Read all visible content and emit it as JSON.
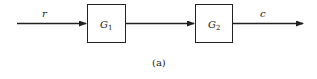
{
  "diagram": {
    "type": "block-diagram-series",
    "input_signal": "r",
    "output_signal": "c",
    "blocks": [
      {
        "name": "G",
        "subscript": "1"
      },
      {
        "name": "G",
        "subscript": "2"
      }
    ],
    "caption": "(a)"
  },
  "colors": {
    "line": "#222222",
    "background": "#ffffff"
  }
}
